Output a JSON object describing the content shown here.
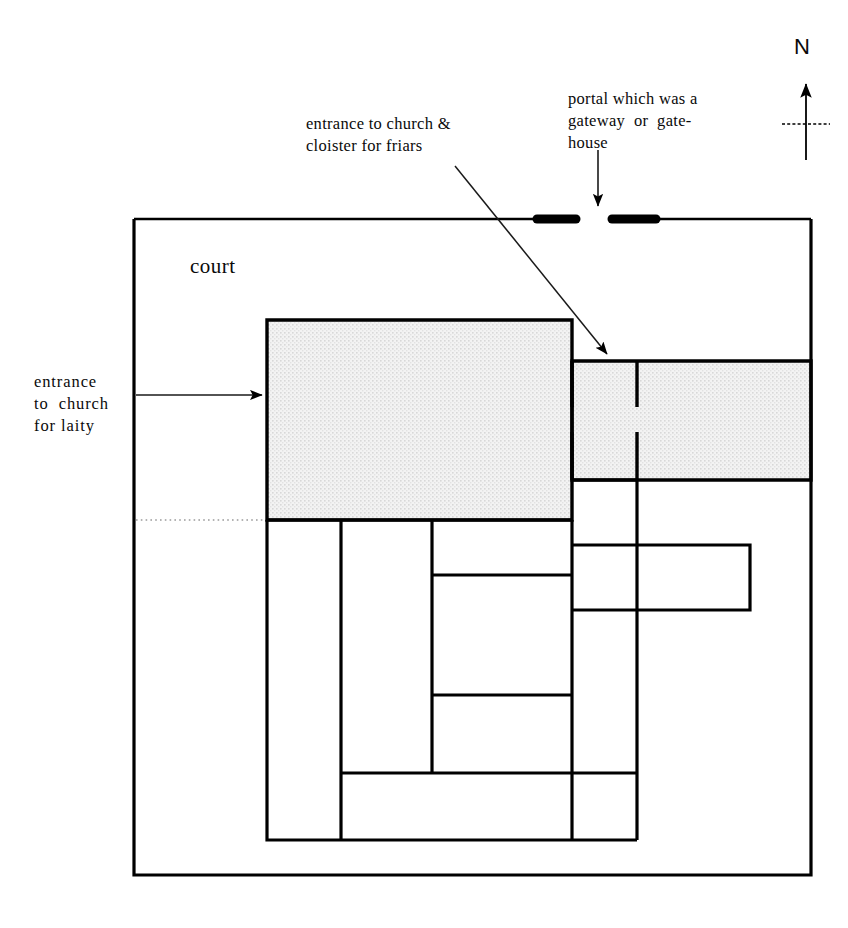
{
  "figure": {
    "kind": "architectural-floor-plan",
    "background_color": "#ffffff",
    "ink_color": "#000000",
    "shade_color": "#ebebeb"
  },
  "annotations": {
    "entrance_friars": "entrance to church &\ncloister for friars",
    "portal": "portal which was a\ngateway  or  gate-\nhouse",
    "entrance_laity": "entrance\nto  church\nfor laity",
    "court": "court",
    "north": "N"
  },
  "compass": {
    "label": "N",
    "arrow_direction": "up",
    "has_crossbar": true
  },
  "leaders": [
    {
      "name": "entrance-friars-leader",
      "from": [
        455,
        166
      ],
      "to": [
        610,
        357
      ],
      "arrowhead": "end",
      "style": "thin-diagonal"
    },
    {
      "name": "portal-leader",
      "from": [
        598,
        152
      ],
      "to": [
        598,
        212
      ],
      "arrowhead": "end",
      "style": "thin-vertical"
    },
    {
      "name": "entrance-laity-leader",
      "from": [
        134,
        395
      ],
      "to": [
        266,
        395
      ],
      "arrowhead": "end",
      "style": "thin-horizontal"
    }
  ],
  "plan": {
    "precinct_wall": {
      "x": 134,
      "y": 219,
      "w": 677,
      "h": 656
    },
    "portal_gap": {
      "y": 219,
      "left_jamb": [
        535,
        578
      ],
      "right_jamb": [
        610,
        659
      ],
      "gap": [
        578,
        610
      ]
    },
    "dotted_sight_line": {
      "y": 520,
      "x1": 136,
      "x2": 267
    },
    "church_nave": {
      "x": 267,
      "y": 320,
      "w": 305,
      "h": 200,
      "shaded": true
    },
    "church_chancel": {
      "x": 572,
      "y": 361,
      "w": 239,
      "h": 119,
      "shaded": true
    },
    "cloister_block": {
      "x": 267,
      "y": 520,
      "w": 370,
      "h": 320
    },
    "rooms": [
      {
        "name": "west-range",
        "x": 267,
        "y": 520,
        "w": 74,
        "h": 320
      },
      {
        "name": "west-walk",
        "x": 341,
        "y": 520,
        "w": 91,
        "h": 253
      },
      {
        "name": "north-walk",
        "x": 432,
        "y": 520,
        "w": 140,
        "h": 55
      },
      {
        "name": "garth",
        "x": 432,
        "y": 575,
        "w": 140,
        "h": 120
      },
      {
        "name": "south-walk",
        "x": 432,
        "y": 695,
        "w": 140,
        "h": 78
      },
      {
        "name": "south-range",
        "x": 341,
        "y": 773,
        "w": 296,
        "h": 67
      },
      {
        "name": "east-range-upper",
        "x": 572,
        "y": 480,
        "w": 65,
        "h": 65
      },
      {
        "name": "east-annex",
        "x": 572,
        "y": 545,
        "w": 178,
        "h": 65
      },
      {
        "name": "east-range-lower",
        "x": 572,
        "y": 610,
        "w": 65,
        "h": 163
      }
    ],
    "internal_walls_with_doorways": [
      {
        "x": 572,
        "y1": 361,
        "y2": 480,
        "gap": [
          407,
          432
        ]
      },
      {
        "x": 637,
        "y1": 361,
        "y2": 480,
        "gap": [
          407,
          432
        ]
      }
    ]
  }
}
